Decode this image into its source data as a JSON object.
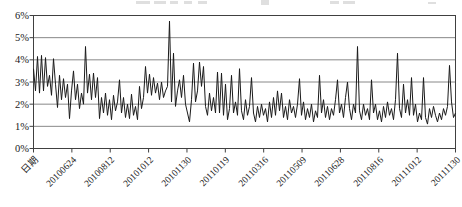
{
  "chart_data": {
    "type": "line",
    "title": "",
    "xlabel": "日期",
    "ylabel": "",
    "ylim_pct": [
      0,
      6
    ],
    "grid": true,
    "legend": "none",
    "y_ticks": [
      "0%",
      "1%",
      "2%",
      "3%",
      "4%",
      "5%",
      "6%"
    ],
    "x_ticks": [
      "日期",
      "20100624",
      "20100812",
      "20101012",
      "20101130",
      "20110119",
      "20110316",
      "20110509",
      "20110628",
      "20110816",
      "20111012",
      "20111130"
    ],
    "series": [
      {
        "name": "daily-rate-percent",
        "color": "#1a1a1a",
        "values_pct": [
          3.6,
          2.6,
          4.15,
          2.5,
          4.2,
          2.6,
          4.1,
          2.8,
          3.3,
          2.4,
          4.05,
          2.9,
          1.85,
          3.3,
          2.2,
          3.15,
          2.3,
          2.9,
          1.35,
          2.6,
          3.5,
          2.2,
          2.9,
          1.8,
          2.5,
          2.0,
          4.6,
          2.5,
          3.35,
          2.2,
          3.4,
          2.3,
          3.2,
          1.35,
          2.3,
          1.6,
          2.5,
          1.5,
          2.2,
          1.3,
          2.4,
          1.7,
          2.1,
          3.1,
          1.6,
          2.3,
          1.4,
          2.0,
          1.35,
          2.45,
          1.5,
          1.9,
          1.3,
          2.8,
          1.8,
          2.3,
          3.7,
          2.5,
          3.35,
          2.4,
          3.2,
          2.5,
          2.95,
          2.2,
          3.0,
          2.3,
          2.6,
          2.8,
          5.75,
          2.1,
          4.3,
          1.9,
          2.6,
          3.1,
          2.3,
          3.3,
          2.0,
          1.6,
          1.2,
          2.2,
          3.85,
          2.1,
          2.6,
          3.9,
          2.8,
          3.7,
          1.9,
          1.5,
          2.5,
          1.7,
          2.3,
          1.6,
          3.45,
          1.6,
          3.4,
          1.5,
          2.9,
          1.3,
          1.8,
          3.3,
          1.6,
          2.1,
          1.5,
          3.6,
          1.7,
          1.3,
          2.2,
          1.5,
          1.9,
          3.2,
          1.6,
          1.2,
          1.9,
          1.4,
          2.0,
          1.5,
          1.8,
          1.2,
          2.1,
          1.4,
          2.3,
          1.5,
          2.6,
          1.7,
          2.5,
          1.4,
          1.9,
          1.3,
          2.2,
          1.6,
          1.9,
          1.4,
          2.0,
          3.15,
          1.5,
          2.1,
          1.3,
          1.8,
          1.4,
          2.0,
          1.2,
          1.7,
          1.4,
          3.3,
          1.6,
          2.2,
          1.4,
          1.9,
          1.3,
          1.8,
          1.5,
          2.2,
          3.1,
          1.6,
          2.0,
          1.4,
          2.3,
          3.0,
          1.8,
          1.3,
          2.0,
          1.6,
          4.6,
          1.7,
          1.3,
          2.0,
          1.5,
          1.8,
          1.3,
          3.1,
          1.6,
          2.0,
          1.3,
          1.7,
          1.2,
          1.9,
          1.4,
          2.1,
          1.5,
          1.8,
          1.3,
          2.2,
          4.3,
          1.8,
          1.4,
          2.9,
          1.6,
          2.2,
          1.5,
          3.2,
          1.5,
          2.0,
          1.2,
          1.6,
          1.3,
          3.2,
          1.4,
          1.1,
          1.8,
          1.4,
          1.9,
          1.5,
          1.2,
          1.6,
          1.3,
          1.8,
          1.5,
          1.9,
          3.75,
          2.1,
          1.4,
          1.6
        ]
      }
    ]
  },
  "colors": {
    "background": "#ffffff",
    "line": "#1a1a1a",
    "grid": "#888888",
    "axis": "#404040",
    "text": "#1a1a1a"
  }
}
